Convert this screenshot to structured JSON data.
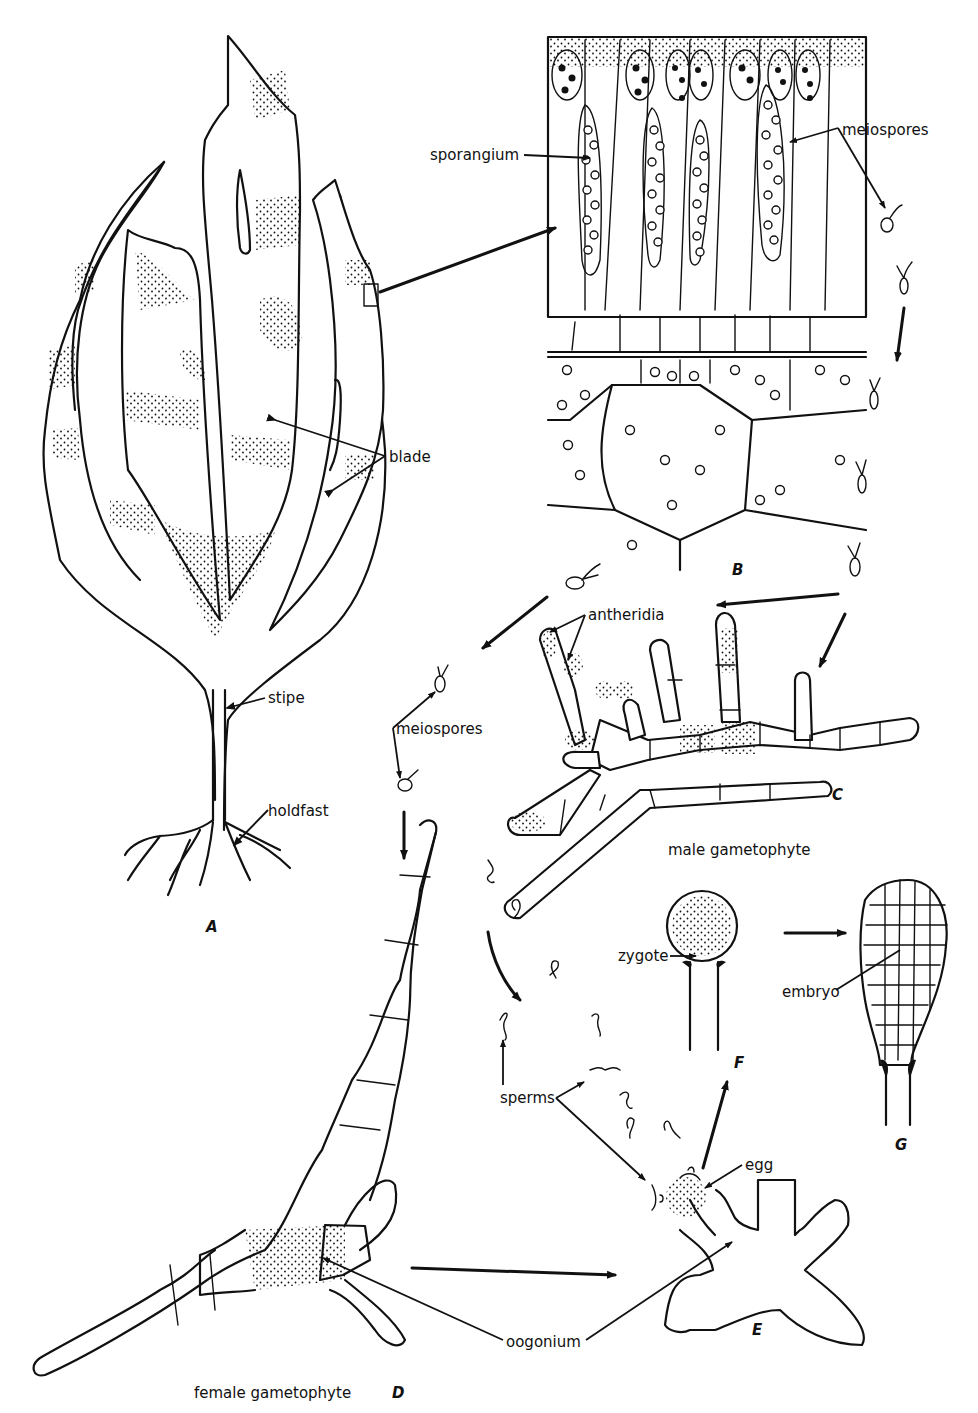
{
  "figure": {
    "panels": {
      "A": "A",
      "B": "B",
      "C": "C",
      "D": "D",
      "E": "E",
      "F": "F",
      "G": "G"
    },
    "labels": {
      "sporangium": "sporangium",
      "meiospores_top": "meiospores",
      "blade": "blade",
      "stipe": "stipe",
      "holdfast": "holdfast",
      "antheridia": "antheridia",
      "meiospores_mid": "meiospores",
      "male_gametophyte": "male gametophyte",
      "zygote": "zygote",
      "embryo": "embryo",
      "sperms": "sperms",
      "egg": "egg",
      "oogonium": "oogonium",
      "female_gametophyte": "female gametophyte"
    },
    "colors": {
      "ink": "#111111",
      "background": "#ffffff"
    }
  }
}
